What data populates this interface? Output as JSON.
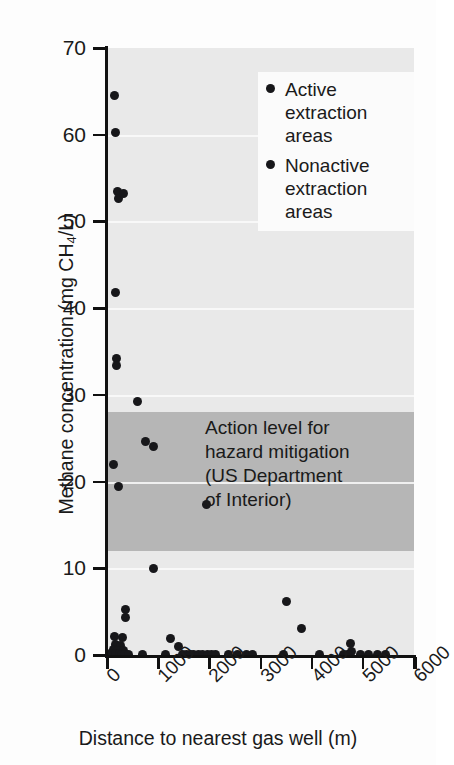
{
  "chart_data": {
    "type": "scatter",
    "title": "",
    "xlabel": "Distance to nearest gas well (m)",
    "ylabel": "Methane concentration (mg CH4/L)",
    "ylabel_parts": {
      "pre": "Methane concentration (mg CH",
      "sub": "4",
      "post": "/L)"
    },
    "xlim": [
      0,
      6000
    ],
    "ylim": [
      0,
      70
    ],
    "xticks": [
      0,
      1000,
      2000,
      3000,
      4000,
      5000,
      6000
    ],
    "xtick_labels": [
      "0",
      "1000",
      "2000",
      "3000",
      "4000",
      "5000",
      "6000"
    ],
    "yticks": [
      0,
      10,
      20,
      30,
      40,
      50,
      60,
      70
    ],
    "ytick_labels": [
      "0",
      "10",
      "20",
      "30",
      "40",
      "50",
      "60",
      "70"
    ],
    "grid": "horizontal-white",
    "legend_position": "top-right",
    "legend": [
      {
        "label": "Active extraction areas",
        "marker": "filled-circle",
        "color": "#17171a"
      },
      {
        "label": "Nonactive extraction areas",
        "marker": "filled-circle",
        "color": "#17171a"
      }
    ],
    "annotations": [
      {
        "text": "Action level for hazard mitigation (US Department of Interior)",
        "lines": [
          "Action level for",
          "hazard mitigation",
          "(US Department",
          "of Interior)"
        ],
        "band_ymin": 12,
        "band_ymax": 28,
        "band_color": "#b6b6b6"
      }
    ],
    "plot_background": "#e9e9e9",
    "points": [
      {
        "x": 150,
        "y": 64.5
      },
      {
        "x": 160,
        "y": 60.3
      },
      {
        "x": 200,
        "y": 53.5
      },
      {
        "x": 230,
        "y": 52.6
      },
      {
        "x": 330,
        "y": 53.2
      },
      {
        "x": 170,
        "y": 41.8
      },
      {
        "x": 180,
        "y": 34.2
      },
      {
        "x": 190,
        "y": 33.4
      },
      {
        "x": 600,
        "y": 29.2
      },
      {
        "x": 760,
        "y": 24.6
      },
      {
        "x": 900,
        "y": 24.0
      },
      {
        "x": 130,
        "y": 22.0
      },
      {
        "x": 230,
        "y": 19.4
      },
      {
        "x": 1950,
        "y": 17.3
      },
      {
        "x": 900,
        "y": 10.0
      },
      {
        "x": 3500,
        "y": 6.2
      },
      {
        "x": 360,
        "y": 5.2
      },
      {
        "x": 370,
        "y": 4.3
      },
      {
        "x": 3800,
        "y": 3.0
      },
      {
        "x": 140,
        "y": 2.1
      },
      {
        "x": 300,
        "y": 2.0
      },
      {
        "x": 1250,
        "y": 1.9
      },
      {
        "x": 4750,
        "y": 1.3
      },
      {
        "x": 160,
        "y": 1.2
      },
      {
        "x": 270,
        "y": 1.1
      },
      {
        "x": 1400,
        "y": 1.0
      },
      {
        "x": 120,
        "y": 0.6
      },
      {
        "x": 210,
        "y": 0.5
      },
      {
        "x": 330,
        "y": 0.5
      },
      {
        "x": 4780,
        "y": 0.4
      },
      {
        "x": 60,
        "y": 0.15
      },
      {
        "x": 110,
        "y": 0.15
      },
      {
        "x": 170,
        "y": 0.12
      },
      {
        "x": 240,
        "y": 0.12
      },
      {
        "x": 290,
        "y": 0.1
      },
      {
        "x": 350,
        "y": 0.1
      },
      {
        "x": 420,
        "y": 0.1
      },
      {
        "x": 700,
        "y": 0.1
      },
      {
        "x": 1150,
        "y": 0.1
      },
      {
        "x": 1480,
        "y": 0.1
      },
      {
        "x": 1560,
        "y": 0.1
      },
      {
        "x": 1630,
        "y": 0.1
      },
      {
        "x": 1700,
        "y": 0.1
      },
      {
        "x": 1790,
        "y": 0.1
      },
      {
        "x": 1870,
        "y": 0.1
      },
      {
        "x": 1960,
        "y": 0.1
      },
      {
        "x": 2050,
        "y": 0.1
      },
      {
        "x": 2130,
        "y": 0.1
      },
      {
        "x": 2380,
        "y": 0.1
      },
      {
        "x": 2560,
        "y": 0.1
      },
      {
        "x": 2720,
        "y": 0.1
      },
      {
        "x": 2840,
        "y": 0.1
      },
      {
        "x": 3450,
        "y": 0.1
      },
      {
        "x": 4150,
        "y": 0.1
      },
      {
        "x": 4620,
        "y": 0.1
      },
      {
        "x": 4700,
        "y": 0.1
      },
      {
        "x": 4950,
        "y": 0.1
      },
      {
        "x": 5120,
        "y": 0.1
      },
      {
        "x": 5280,
        "y": 0.1
      },
      {
        "x": 5440,
        "y": 0.1
      }
    ]
  }
}
